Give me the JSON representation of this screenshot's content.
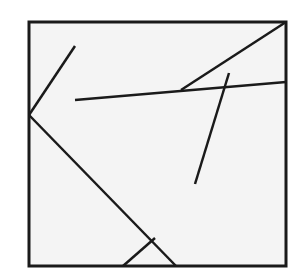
{
  "diagram": {
    "type": "geometry-line-figure",
    "width": 300,
    "height": 274,
    "background": "#ffffff",
    "fill": "#f4f4f4",
    "stroke_color": "#1a1a1a",
    "frame": {
      "x": 29,
      "y": 22,
      "width": 257,
      "height": 244,
      "stroke_width": 3
    },
    "segments": [
      {
        "id": "seg-1",
        "x1": 75,
        "y1": 46,
        "x2": 29,
        "y2": 115,
        "stroke_width": 2.5
      },
      {
        "id": "seg-2",
        "x1": 29,
        "y1": 115,
        "x2": 176,
        "y2": 266,
        "stroke_width": 2.5
      },
      {
        "id": "seg-3",
        "x1": 123,
        "y1": 266,
        "x2": 155,
        "y2": 238,
        "stroke_width": 2.5
      },
      {
        "id": "seg-4",
        "x1": 75,
        "y1": 100,
        "x2": 286,
        "y2": 82,
        "stroke_width": 2.5
      },
      {
        "id": "seg-5",
        "x1": 181,
        "y1": 90,
        "x2": 286,
        "y2": 22,
        "stroke_width": 2.5
      },
      {
        "id": "seg-6",
        "x1": 229,
        "y1": 73,
        "x2": 195,
        "y2": 184,
        "stroke_width": 2.5
      }
    ]
  }
}
